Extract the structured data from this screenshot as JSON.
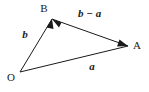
{
  "figure": {
    "name": "vector-triangle-diagram",
    "background_color": "#ffffff",
    "stroke_color": "#1a1a1a",
    "width": 149,
    "height": 92
  },
  "points": {
    "origin": {
      "label": "O",
      "x": 20,
      "y": 72,
      "label_x": 11,
      "label_y": 81
    },
    "a_point": {
      "label": "A",
      "x": 128,
      "y": 46,
      "label_x": 133,
      "label_y": 49
    },
    "b_point": {
      "label": "B",
      "x": 52,
      "y": 19,
      "label_x": 44,
      "label_y": 12
    }
  },
  "vectors": [
    {
      "name": "vector-a",
      "label": "a",
      "from": "O",
      "to": "A",
      "x1": 20,
      "y1": 72,
      "x2": 128,
      "y2": 46,
      "label_x": 92,
      "label_y": 70
    },
    {
      "name": "vector-b",
      "label": "b",
      "from": "O",
      "to": "B",
      "x1": 20,
      "y1": 72,
      "x2": 52,
      "y2": 19,
      "label_x": 25,
      "label_y": 38
    },
    {
      "name": "vector-b-minus-a",
      "label": "b − a",
      "from": "A",
      "to": "B",
      "x1": 128,
      "y1": 46,
      "x2": 52,
      "y2": 19,
      "label_x": 78,
      "label_y": 17
    }
  ]
}
